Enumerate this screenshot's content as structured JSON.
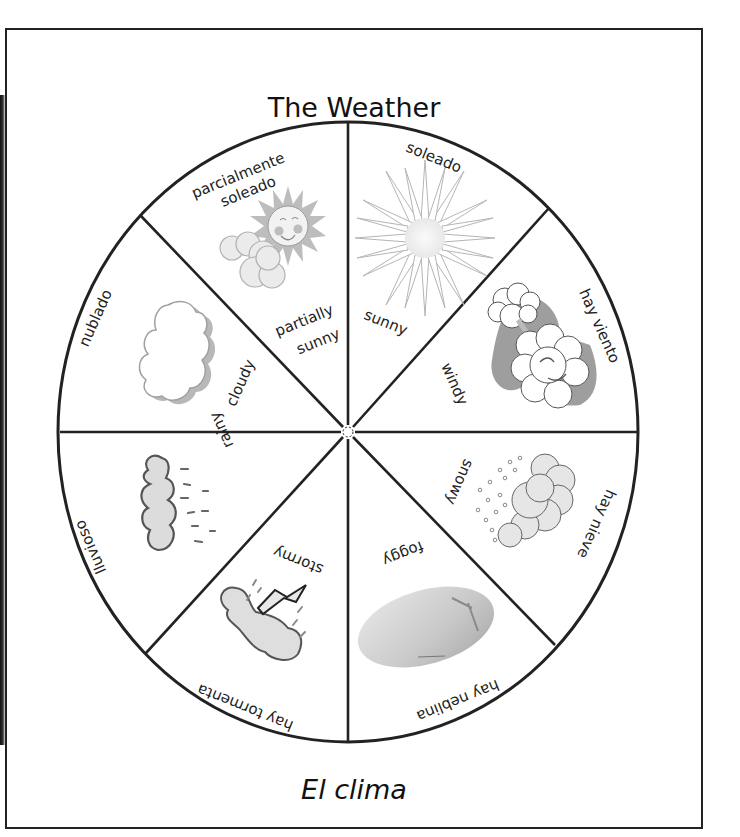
{
  "page": {
    "title": "The Weather",
    "subtitle": "El clima"
  },
  "wheel": {
    "sections": [
      {
        "id": "sunny",
        "english": "sunny",
        "spanish": "soleado",
        "icon": "sun-icon"
      },
      {
        "id": "windy",
        "english": "windy",
        "spanish": "hay viento",
        "icon": "wind-cloud-icon"
      },
      {
        "id": "snowy",
        "english": "snowy",
        "spanish": "hay nieve",
        "icon": "snow-cloud-icon"
      },
      {
        "id": "foggy",
        "english": "foggy",
        "spanish": "hay neblina",
        "icon": "fog-icon"
      },
      {
        "id": "stormy",
        "english": "stormy",
        "spanish": "hay tormenta",
        "icon": "storm-cloud-icon"
      },
      {
        "id": "rainy",
        "english": "rainy",
        "spanish": "lluvioso",
        "icon": "rain-cloud-icon"
      },
      {
        "id": "cloudy",
        "english": "cloudy",
        "spanish": "nublado",
        "icon": "cloud-icon"
      },
      {
        "id": "partially-sunny",
        "english_line1": "partially",
        "english_line2": "sunny",
        "spanish_line1": "parcialmente",
        "spanish_line2": "soleado",
        "icon": "sun-behind-cloud-icon"
      }
    ]
  },
  "colors": {
    "ink": "#222222",
    "icon_gray": "#cfcfcf",
    "icon_dark": "#9a9a9a"
  }
}
